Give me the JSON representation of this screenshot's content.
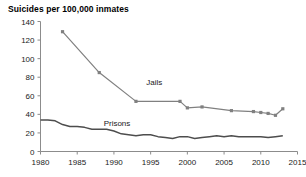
{
  "chart_data": {
    "type": "line",
    "title": "Suicides per 100,000 inmates",
    "xlabel": "",
    "ylabel": "",
    "xlim": [
      1980,
      2015
    ],
    "ylim": [
      0,
      140
    ],
    "grid": false,
    "legend_position": "inline-labels",
    "xticks": [
      1980,
      1985,
      1990,
      1995,
      2000,
      2005,
      2010,
      2015
    ],
    "yticks": [
      0,
      20,
      40,
      60,
      80,
      100,
      120,
      140
    ],
    "series": [
      {
        "name": "Jails",
        "color": "#808080",
        "marker": "square",
        "label_x": 1994.4,
        "label_y": 72,
        "x": [
          1983,
          1988,
          1993,
          1999,
          2000,
          2002,
          2006,
          2009,
          2010,
          2011,
          2012,
          2013
        ],
        "values": [
          129,
          85,
          54,
          54,
          47,
          48,
          44,
          43,
          42,
          41,
          39,
          46
        ]
      },
      {
        "name": "Prisons",
        "color": "#4d4d4d",
        "marker": "none",
        "label_x": 1988.6,
        "label_y": 27,
        "x": [
          1980,
          1981,
          1982,
          1983,
          1984,
          1985,
          1986,
          1987,
          1988,
          1989,
          1990,
          1991,
          1992,
          1993,
          1994,
          1995,
          1996,
          1997,
          1998,
          1999,
          2000,
          2001,
          2002,
          2003,
          2004,
          2005,
          2006,
          2007,
          2008,
          2009,
          2010,
          2011,
          2012,
          2013
        ],
        "values": [
          34,
          34,
          33,
          29,
          27,
          27,
          26,
          24,
          24,
          24,
          22,
          19,
          18,
          17,
          18,
          18,
          16,
          15,
          14,
          16,
          16,
          14,
          15,
          16,
          17,
          16,
          17,
          16,
          16,
          16,
          16,
          15,
          16,
          17
        ]
      }
    ]
  },
  "axis": {
    "y_tick_labels": [
      "140",
      "120",
      "100",
      "80",
      "60",
      "40",
      "20",
      "0"
    ],
    "x_tick_labels": [
      "1980",
      "1985",
      "1990",
      "1995",
      "2000",
      "2005",
      "2010",
      "2015"
    ]
  },
  "labels": {
    "jails": "Jails",
    "prisons": "Prisons"
  },
  "colors": {
    "axis": "#8c8c8c",
    "jails": "#808080",
    "prisons": "#4d4d4d",
    "text": "#1a1a1a",
    "background": "#ffffff"
  }
}
